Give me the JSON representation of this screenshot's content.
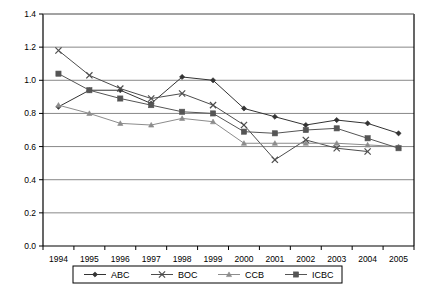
{
  "chart_data": {
    "type": "line",
    "title": "",
    "xlabel": "",
    "ylabel": "",
    "categories": [
      "1994",
      "1995",
      "1996",
      "1997",
      "1998",
      "1999",
      "2000",
      "2001",
      "2002",
      "2003",
      "2004",
      "2005"
    ],
    "ylim": [
      0.0,
      1.4
    ],
    "yticks": [
      "0.0",
      "0.2",
      "0.4",
      "0.6",
      "0.8",
      "1.0",
      "1.2",
      "1.4"
    ],
    "ytick_values": [
      0.0,
      0.2,
      0.4,
      0.6,
      0.8,
      1.0,
      1.2,
      1.4
    ],
    "grid": true,
    "grid_axis": "y",
    "legend_position": "bottom",
    "series": [
      {
        "name": "ABC",
        "marker": "diamond",
        "color": "#333333",
        "values": [
          0.84,
          0.94,
          0.94,
          0.86,
          1.02,
          1.0,
          0.83,
          0.78,
          0.73,
          0.76,
          0.74,
          0.68
        ]
      },
      {
        "name": "BOC",
        "marker": "x",
        "color": "#4d4d4d",
        "values": [
          1.18,
          1.03,
          0.95,
          0.89,
          0.92,
          0.85,
          0.73,
          0.52,
          0.64,
          0.59,
          0.57,
          null
        ]
      },
      {
        "name": "CCB",
        "marker": "triangle",
        "color": "#8c8c8c",
        "values": [
          0.85,
          0.8,
          0.74,
          0.73,
          0.77,
          0.75,
          0.62,
          0.62,
          0.62,
          0.62,
          0.61,
          0.6
        ]
      },
      {
        "name": "ICBC",
        "marker": "square",
        "color": "#555555",
        "values": [
          1.04,
          0.94,
          0.89,
          0.85,
          0.81,
          0.8,
          0.69,
          0.68,
          0.7,
          0.71,
          0.65,
          0.59
        ]
      }
    ]
  },
  "legend": {
    "items": [
      {
        "label": "ABC",
        "marker": "diamond"
      },
      {
        "label": "BOC",
        "marker": "x"
      },
      {
        "label": "CCB",
        "marker": "triangle"
      },
      {
        "label": "ICBC",
        "marker": "square"
      }
    ]
  }
}
